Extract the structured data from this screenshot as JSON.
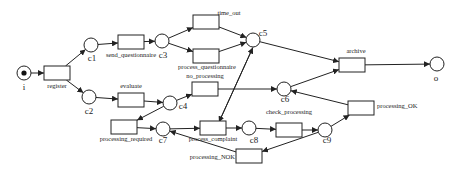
{
  "diagram": {
    "type": "petri-net",
    "places": [
      {
        "id": "i",
        "label": "i",
        "x": 24,
        "y": 73,
        "token": true,
        "lx": 24,
        "ly": 90
      },
      {
        "id": "c1",
        "label": "c1",
        "x": 91,
        "y": 45,
        "lx": 92,
        "ly": 61
      },
      {
        "id": "c2",
        "label": "c2",
        "x": 89,
        "y": 97,
        "lx": 89,
        "ly": 114
      },
      {
        "id": "c3",
        "label": "c3",
        "x": 162,
        "y": 41,
        "lx": 163,
        "ly": 58
      },
      {
        "id": "c4",
        "label": "c4",
        "x": 170,
        "y": 103,
        "lx": 183,
        "ly": 109
      },
      {
        "id": "c5",
        "label": "c5",
        "x": 253,
        "y": 40,
        "lx": 263,
        "ly": 36
      },
      {
        "id": "c6",
        "label": "c6",
        "x": 284,
        "y": 89,
        "lx": 285,
        "ly": 102
      },
      {
        "id": "c7",
        "label": "c7",
        "x": 163,
        "y": 129,
        "lx": 163,
        "ly": 143
      },
      {
        "id": "c8",
        "label": "c8",
        "x": 249,
        "y": 128,
        "lx": 254,
        "ly": 143
      },
      {
        "id": "c9",
        "label": "c9",
        "x": 325,
        "y": 130,
        "lx": 327,
        "ly": 143
      },
      {
        "id": "o",
        "label": "o",
        "x": 437,
        "y": 64,
        "lx": 436,
        "ly": 81
      }
    ],
    "transitions": [
      {
        "id": "register",
        "label": "register",
        "x": 44,
        "y": 66,
        "lx": 57,
        "ly": 88,
        "anchor": "middle"
      },
      {
        "id": "send_questionnaire",
        "label": "send_questionnaire",
        "x": 118,
        "y": 35,
        "lx": 131,
        "ly": 57,
        "anchor": "middle"
      },
      {
        "id": "evaluate",
        "label": "evaluate",
        "x": 118,
        "y": 93,
        "lx": 131,
        "ly": 88,
        "anchor": "middle"
      },
      {
        "id": "time_out",
        "label": "time_out",
        "x": 193,
        "y": 15,
        "lx": 229,
        "ly": 15,
        "anchor": "middle"
      },
      {
        "id": "process_questionnaire",
        "label": "process_questionnaire",
        "x": 193,
        "y": 49,
        "lx": 207,
        "ly": 69,
        "anchor": "middle"
      },
      {
        "id": "no_processing",
        "label": "no_processing",
        "x": 192,
        "y": 82,
        "lx": 205,
        "ly": 78,
        "anchor": "middle"
      },
      {
        "id": "processing_required",
        "label": "processing_required",
        "x": 111,
        "y": 120,
        "lx": 126,
        "ly": 141,
        "anchor": "middle"
      },
      {
        "id": "process_complaint",
        "label": "process_complaint",
        "x": 200,
        "y": 121,
        "lx": 213,
        "ly": 141,
        "anchor": "middle"
      },
      {
        "id": "check_processing",
        "label": "check_processing",
        "x": 276,
        "y": 123,
        "lx": 289,
        "ly": 114,
        "anchor": "middle"
      },
      {
        "id": "archive",
        "label": "archive",
        "x": 339,
        "y": 58,
        "lx": 356,
        "ly": 53,
        "anchor": "middle"
      },
      {
        "id": "processing_OK",
        "label": "processing_OK",
        "x": 348,
        "y": 101,
        "lx": 377,
        "ly": 108,
        "anchor": "start"
      },
      {
        "id": "processing_NOK",
        "label": "processing_NOK",
        "x": 236,
        "y": 149,
        "lx": 235,
        "ly": 159,
        "anchor": "end"
      }
    ],
    "arcs": [
      [
        "i",
        "register"
      ],
      [
        "register",
        "c1"
      ],
      [
        "register",
        "c2"
      ],
      [
        "c1",
        "send_questionnaire"
      ],
      [
        "send_questionnaire",
        "c3"
      ],
      [
        "c3",
        "time_out"
      ],
      [
        "c3",
        "process_questionnaire"
      ],
      [
        "time_out",
        "c5"
      ],
      [
        "process_questionnaire",
        "c5"
      ],
      [
        "c2",
        "evaluate"
      ],
      [
        "evaluate",
        "c4"
      ],
      [
        "c4",
        "no_processing"
      ],
      [
        "c4",
        "processing_required"
      ],
      [
        "no_processing",
        "c6"
      ],
      [
        "processing_required",
        "c7"
      ],
      [
        "c7",
        "process_complaint"
      ],
      [
        "process_complaint",
        "c8"
      ],
      [
        "c8",
        "check_processing"
      ],
      [
        "check_processing",
        "c9"
      ],
      [
        "c9",
        "processing_OK"
      ],
      [
        "c9",
        "processing_NOK"
      ],
      [
        "processing_NOK",
        "c7"
      ],
      [
        "processing_OK",
        "c6"
      ],
      [
        "c5",
        "archive"
      ],
      [
        "c6",
        "archive"
      ],
      [
        "archive",
        "o"
      ],
      [
        "c5",
        "process_complaint"
      ],
      [
        "process_complaint",
        "c5"
      ]
    ]
  }
}
